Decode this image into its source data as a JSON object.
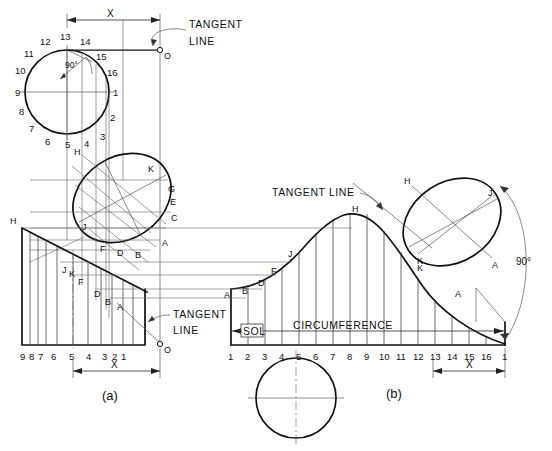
{
  "figure": {
    "title_a": "(a)",
    "title_b": "(b)",
    "labels": {
      "tangent_line": "TANGENT LINE",
      "tangent": "TANGENT",
      "line": "LINE",
      "circumference": "CIRCUMFERENCE",
      "sol": "SOL",
      "angle_90": "90°",
      "dim_x": "X",
      "origin": "O"
    }
  },
  "top_circle": {
    "name": "generating-circle-top-left",
    "divisions": 16,
    "numbers": [
      "1",
      "2",
      "3",
      "4",
      "5",
      "6",
      "7",
      "8",
      "9",
      "10",
      "11",
      "12",
      "13",
      "14",
      "15",
      "16"
    ],
    "angle_note": "90°"
  },
  "bottom_circle": {
    "name": "generating-circle-bottom",
    "divisions": 16
  },
  "left_ellipse": {
    "name": "inclined-circle-view-a",
    "points": [
      "H",
      "K",
      "G",
      "E",
      "C",
      "A",
      "B",
      "D",
      "F",
      "J"
    ]
  },
  "right_ellipse": {
    "name": "inclined-circle-view-b",
    "points": [
      "H",
      "J",
      "A",
      "K"
    ],
    "angle_note": "90°"
  },
  "scale_a": {
    "name": "division-scale-a",
    "numbers": [
      "9",
      "8",
      "7",
      "6",
      "5",
      "4",
      "3",
      "2",
      "1"
    ]
  },
  "scale_b": {
    "name": "division-scale-b",
    "numbers": [
      "1",
      "2",
      "3",
      "4",
      "5",
      "6",
      "7",
      "8",
      "9",
      "10",
      "11",
      "12",
      "13",
      "14",
      "15",
      "16",
      "1"
    ]
  },
  "curve_a_points": {
    "name": "helix-development-a",
    "points": [
      "H",
      "J",
      "K",
      "F",
      "D",
      "B",
      "A"
    ]
  },
  "curve_b_points": {
    "name": "helix-development-b",
    "points": [
      "A",
      "B",
      "D",
      "F",
      "J",
      "H",
      "K",
      "A"
    ]
  },
  "dimensions": [
    {
      "id": "x-top",
      "label": "X"
    },
    {
      "id": "x-bottom-left",
      "label": "X"
    },
    {
      "id": "x-bottom-right",
      "label": "X"
    }
  ],
  "annotations": [
    {
      "id": "tangent-top",
      "text": "TANGENT"
    },
    {
      "id": "tangent-top-2",
      "text": "LINE"
    },
    {
      "id": "tangent-mid",
      "text": "TANGENT"
    },
    {
      "id": "tangent-mid-2",
      "text": "LINE"
    },
    {
      "id": "tangent-right",
      "text": "TANGENT LINE"
    }
  ]
}
